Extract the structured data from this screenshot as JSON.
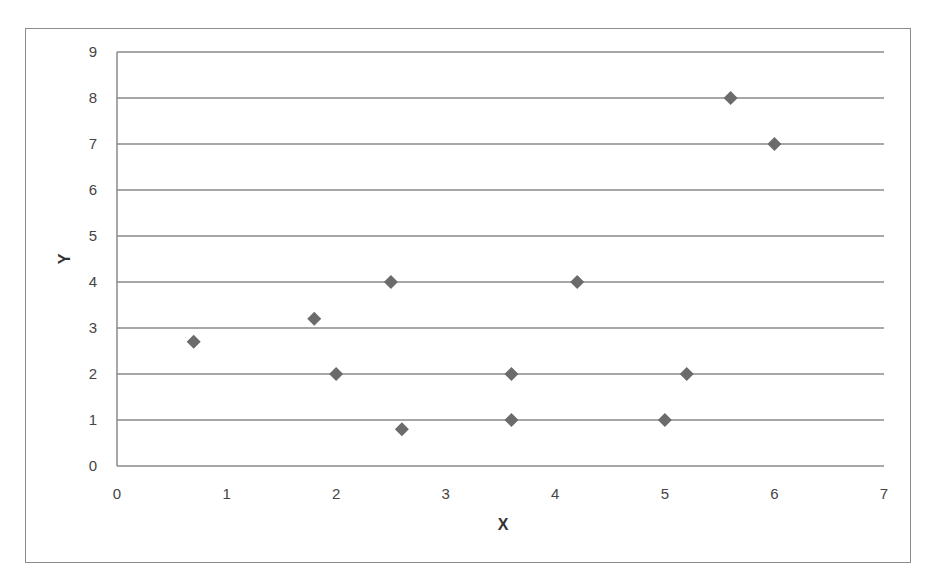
{
  "chart_data": {
    "type": "scatter",
    "title": "",
    "xlabel": "X",
    "ylabel": "Y",
    "xlim": [
      0,
      7
    ],
    "ylim": [
      0,
      9
    ],
    "x_ticks": [
      0,
      1,
      2,
      3,
      4,
      5,
      6,
      7
    ],
    "y_ticks": [
      0,
      1,
      2,
      3,
      4,
      5,
      6,
      7,
      8,
      9
    ],
    "grid": {
      "horizontal": true,
      "vertical": false
    },
    "legend": null,
    "marker": "diamond",
    "marker_color": "#6b6b6b",
    "series": [
      {
        "name": "Series1",
        "points": [
          {
            "x": 0.7,
            "y": 2.7
          },
          {
            "x": 1.8,
            "y": 3.2
          },
          {
            "x": 2.0,
            "y": 2.0
          },
          {
            "x": 2.5,
            "y": 4.0
          },
          {
            "x": 2.6,
            "y": 0.8
          },
          {
            "x": 3.6,
            "y": 2.0
          },
          {
            "x": 3.6,
            "y": 1.0
          },
          {
            "x": 4.2,
            "y": 4.0
          },
          {
            "x": 5.0,
            "y": 1.0
          },
          {
            "x": 5.2,
            "y": 2.0
          },
          {
            "x": 5.6,
            "y": 8.0
          },
          {
            "x": 6.0,
            "y": 7.0
          }
        ]
      }
    ]
  },
  "colors": {
    "gridline": "#8a8a8a",
    "axis": "#8a8a8a",
    "frame": "#8c8c8c",
    "tick_text": "#444444"
  }
}
